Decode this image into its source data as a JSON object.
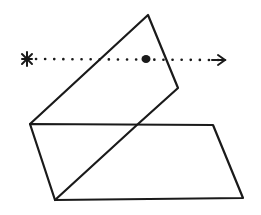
{
  "diagram": {
    "colors": {
      "stroke": "#1a1a1a",
      "background": "#ffffff"
    },
    "horizontal_plane": {
      "points": [
        [
          30,
          124
        ],
        [
          213,
          125
        ],
        [
          243,
          198
        ],
        [
          55,
          200
        ]
      ]
    },
    "tilted_plane": {
      "points": [
        [
          30,
          124
        ],
        [
          148,
          15
        ],
        [
          178,
          88
        ],
        [
          55,
          200
        ]
      ]
    },
    "ray": {
      "start_marker": "asterisk",
      "start": [
        27,
        59
      ],
      "end": [
        224,
        60
      ],
      "end_marker": "arrow",
      "intersection_point": [
        146,
        59
      ],
      "style": "dotted"
    },
    "labels": {
      "ray_start": "source",
      "intersection": "intersection point"
    }
  }
}
